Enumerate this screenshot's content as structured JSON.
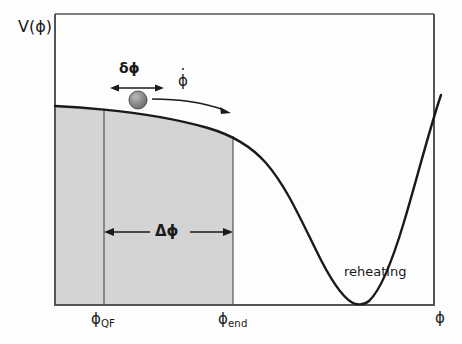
{
  "figure": {
    "type": "diagram",
    "axes": {
      "y_label": "V(ϕ)",
      "x_label": "ϕ",
      "frame": {
        "left": 55,
        "top": 14,
        "right": 434,
        "bottom": 305
      },
      "frame_color": "#555555"
    },
    "labels": {
      "delta_phi": "δϕ",
      "phi_dot_base": "ϕ",
      "big_delta_phi": "Δϕ",
      "reheating": "reheating",
      "phi_qf_base": "ϕ",
      "phi_qf_sub": "QF",
      "phi_end_base": "ϕ",
      "phi_end_sub": "end"
    },
    "shaded_region": {
      "fill": "#d4d4d4",
      "x_start": 55,
      "x_end": 233,
      "top": 106,
      "bottom": 305
    },
    "markers": {
      "phi_qf_x": 104,
      "phi_end_x": 233,
      "minimum_x": 360,
      "ball_center_x": 138,
      "ball_center_y": 100,
      "ball_radius": 9,
      "ball_color": "#8c8c8c",
      "curve_color": "#1a1a1a"
    },
    "curve": {
      "description": "flat plateau then steep sigmoid descent to zero minimum then steep rise",
      "plateau_start_y": 106,
      "minimum_y": 305,
      "right_end_y": 95
    }
  }
}
